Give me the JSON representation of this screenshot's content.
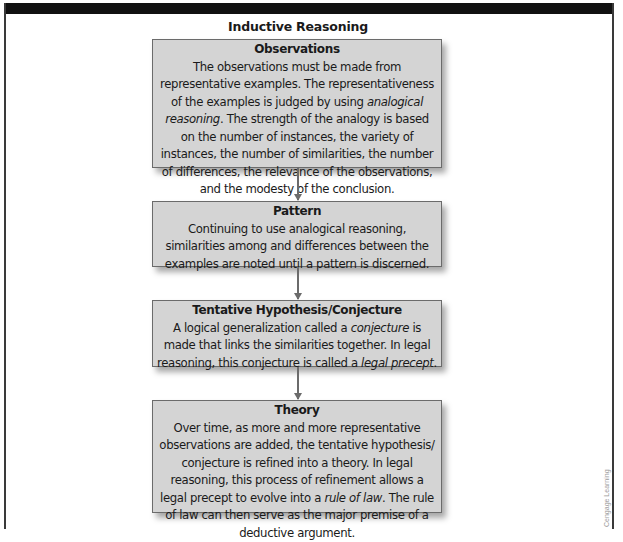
{
  "diagram": {
    "title": "Inductive Reasoning",
    "steps": [
      {
        "heading": "Observations",
        "body_parts": [
          "The observations must be made from representative examples. The representativeness of the examples is judged by using ",
          "analogical reasoning",
          ". The strength of the analogy is based on the number of instances, the variety of instances, the number of similarities, the number of differences, the relevance of the observations, and the modesty of the conclusion."
        ]
      },
      {
        "heading": "Pattern",
        "body_parts": [
          "Continuing to use analogical reasoning, similarities among and differences between the examples are noted until a pattern is discerned."
        ]
      },
      {
        "heading": "Tentative Hypothesis/Conjecture",
        "body_parts": [
          "A logical generalization called a ",
          "conjecture",
          " is made that links the similarities together. In legal reasoning, this conjecture is called a ",
          "legal precept",
          "."
        ]
      },
      {
        "heading": "Theory",
        "body_parts": [
          "Over time, as more and more representative observations are added, the tentative hypothesis/ conjecture is refined into a theory. In legal reasoning, this process of refinement allows a legal precept to evolve into a ",
          "rule of law",
          ". The rule of law can then serve as the major premise of a deductive argument."
        ]
      }
    ],
    "arrows": [
      "down-arrow",
      "down-arrow",
      "down-arrow"
    ],
    "watermark": "Cengage Learning"
  },
  "colors": {
    "box_fill": "#d4d4d4",
    "box_border": "#6b6b6b",
    "top_bar": "#111111",
    "arrow": "#6b6b6b"
  }
}
